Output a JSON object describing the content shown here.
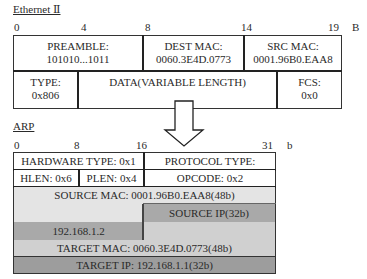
{
  "ethernet": {
    "title": "Ethernet Ⅱ",
    "unit": "B",
    "ticks": [
      "0",
      "4",
      "8",
      "14",
      "19"
    ],
    "row1": {
      "preamble": {
        "label": "PREAMBLE:",
        "value": "101010...1011"
      },
      "dest_mac": {
        "label": "DEST MAC:",
        "value": "0060.3E4D.0773"
      },
      "src_mac": {
        "label": "SRC MAC:",
        "value": "0001.96B0.EAA8"
      }
    },
    "row2": {
      "type": {
        "label": "TYPE:",
        "value": "0x806"
      },
      "data": {
        "label": "DATA(VARIABLE LENGTH)"
      },
      "fcs": {
        "label": "FCS:",
        "value": "0x0"
      }
    }
  },
  "arrow": {
    "icon": "down-arrow-icon"
  },
  "arp": {
    "title": "ARP",
    "unit": "b",
    "ticks": [
      "0",
      "8",
      "16",
      "31"
    ],
    "rows": {
      "hardware_type": "HARDWARE TYPE: 0x1",
      "protocol_type": "PROTOCOL TYPE:",
      "hlen": "HLEN: 0x6",
      "plen": "PLEN: 0x4",
      "opcode": "OPCODE: 0x2",
      "source_mac": "SOURCE MAC: 0001.96B0.EAA8(48b)",
      "source_ip": "SOURCE IP(32b)",
      "source_ip_value": "192.168.1.2",
      "target_mac": "TARGET MAC: 0060.3E4D.0773(48b)",
      "target_ip": "TARGET IP: 192.168.1.1(32b)"
    },
    "colors": {
      "source_mac": "#e4e4e4",
      "source_ip": "#a9a9a9",
      "target_mac": "#d0d0d0",
      "target_ip": "#9d9d9d",
      "white": "#ffffff"
    }
  }
}
